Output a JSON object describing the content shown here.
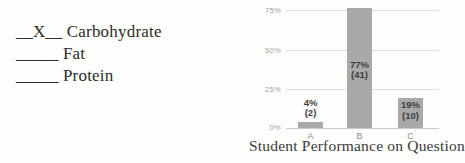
{
  "answers": {
    "items": [
      {
        "blank": "__X__",
        "label": "Carbohydrate"
      },
      {
        "blank": "_____",
        "label": "Fat"
      },
      {
        "blank": "_____",
        "label": "Protein"
      }
    ]
  },
  "chart": {
    "caption": "Student Performance on Question 9",
    "y_ticks": [
      "75%",
      "50%",
      "25%",
      "0%"
    ],
    "bars": [
      {
        "category": "A",
        "value": 4,
        "percent_label": "4%",
        "count_label": "(2)"
      },
      {
        "category": "B",
        "value": 77,
        "percent_label": "77%",
        "count_label": "(41)"
      },
      {
        "category": "C",
        "value": 19,
        "percent_label": "19%",
        "count_label": "(10)"
      }
    ],
    "colors": {
      "bar": "#a9a9a9",
      "gridline": "#dedede",
      "axis_line": "#c9c9c9",
      "tick_text": "#a3a3a3",
      "data_label_text": "#3f3f3f",
      "category_text": "#8c8c8c",
      "caption_text": "#3a3a3a",
      "body_text": "#2d2d2d",
      "background": "#fdfdfc"
    }
  },
  "chart_data": {
    "type": "bar",
    "categories": [
      "A",
      "B",
      "C"
    ],
    "values": [
      4,
      77,
      19
    ],
    "counts": [
      2,
      41,
      10
    ],
    "data_labels": [
      "4% (2)",
      "77% (41)",
      "19% (10)"
    ],
    "title": "Student Performance on Question 9",
    "xlabel": "",
    "ylabel": "",
    "ylim": [
      0,
      80
    ],
    "y_tick_values": [
      0,
      25,
      50,
      75
    ],
    "grid": true,
    "legend": false,
    "bar_color": "#a9a9a9"
  }
}
